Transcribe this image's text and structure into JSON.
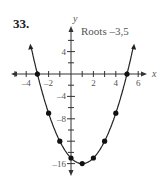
{
  "problem_number": "33.",
  "chart_data": {
    "type": "line",
    "title": "",
    "annotation": "Roots –3,5",
    "xlabel": "x",
    "ylabel": "y",
    "x_ticks": [
      -4,
      -2,
      2,
      4,
      6
    ],
    "y_ticks": [
      4,
      -4,
      -8,
      -16
    ],
    "x_tick_labels": [
      "–4",
      "–2",
      "2",
      "4",
      "6"
    ],
    "y_tick_labels": [
      "4",
      "–4",
      "–8",
      "–16"
    ],
    "xlim": [
      -5,
      7
    ],
    "ylim": [
      -17,
      8
    ],
    "function": "y = x^2 - 2x - 15",
    "series": [
      {
        "name": "parabola",
        "points": [
          {
            "x": -3,
            "y": 0
          },
          {
            "x": -2,
            "y": -7
          },
          {
            "x": -1,
            "y": -12
          },
          {
            "x": 0,
            "y": -15
          },
          {
            "x": 1,
            "y": -16
          },
          {
            "x": 2,
            "y": -15
          },
          {
            "x": 3,
            "y": -12
          },
          {
            "x": 4,
            "y": -7
          },
          {
            "x": 5,
            "y": 0
          }
        ]
      }
    ],
    "grid": false
  }
}
